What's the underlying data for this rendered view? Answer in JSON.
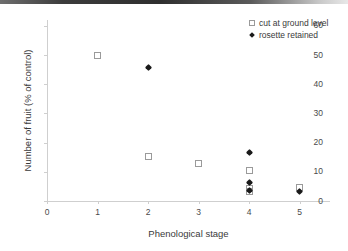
{
  "chart_data": {
    "type": "scatter",
    "title": "",
    "xlabel": "Phenological stage",
    "ylabel": "Number of fruit (% of control)",
    "xlim": [
      0,
      5.6
    ],
    "ylim": [
      0,
      62
    ],
    "xticks": [
      0,
      1,
      2,
      3,
      4,
      5
    ],
    "yticks": [
      0,
      10,
      20,
      30,
      40,
      50,
      60
    ],
    "grid": false,
    "legend_position": "top-right",
    "series": [
      {
        "name": "cut at ground level",
        "marker": "open-square",
        "color": "#9a9a9a",
        "points": [
          {
            "x": 1,
            "y": 49.8
          },
          {
            "x": 2,
            "y": 15.1
          },
          {
            "x": 3,
            "y": 12.7
          },
          {
            "x": 4,
            "y": 10.4
          },
          {
            "x": 4,
            "y": 4.2
          },
          {
            "x": 4,
            "y": 3.1
          },
          {
            "x": 5,
            "y": 4.6
          }
        ]
      },
      {
        "name": "rosette retained",
        "marker": "filled-diamond",
        "color": "#1a1a1a",
        "points": [
          {
            "x": 2,
            "y": 45.6
          },
          {
            "x": 4,
            "y": 16.5
          },
          {
            "x": 4,
            "y": 6.5
          },
          {
            "x": 4,
            "y": 3.6
          },
          {
            "x": 5,
            "y": 3.3
          }
        ]
      }
    ]
  },
  "legend": {
    "entries": [
      {
        "label": "cut at ground level",
        "marker": "open-square"
      },
      {
        "label": "rosette retained",
        "marker": "filled-diamond"
      }
    ]
  }
}
